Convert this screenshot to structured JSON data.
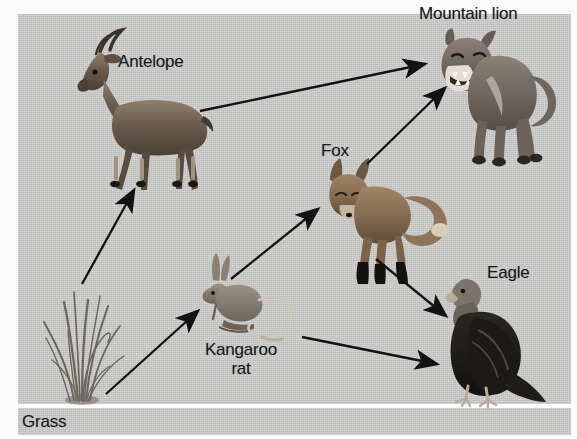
{
  "diagram": {
    "background_color": "#c9c9c7",
    "panel": {
      "x": 18,
      "y": 14,
      "width": 553,
      "height": 390
    },
    "nodes": [
      {
        "id": "grass",
        "label": "Grass",
        "kind": "producer",
        "icon": "grass-icon",
        "label_x": 22,
        "label_y": 412,
        "align": "left"
      },
      {
        "id": "antelope",
        "label": "Antelope",
        "kind": "primary-consumer",
        "icon": "antelope-icon",
        "label_x": 118,
        "label_y": 52,
        "align": "left"
      },
      {
        "id": "kangaroo_rat",
        "label": "Kangaroo\nrat",
        "kind": "primary-consumer",
        "icon": "kangaroo-rat-icon",
        "label_x": 193,
        "label_y": 340,
        "align": "center"
      },
      {
        "id": "fox",
        "label": "Fox",
        "kind": "secondary-consumer",
        "icon": "fox-icon",
        "label_x": 321,
        "label_y": 141,
        "align": "left"
      },
      {
        "id": "eagle",
        "label": "Eagle",
        "kind": "secondary-consumer",
        "icon": "eagle-icon",
        "label_x": 487,
        "label_y": 263,
        "align": "left"
      },
      {
        "id": "mountain_lion",
        "label": "Mountain lion",
        "kind": "tertiary-consumer",
        "icon": "mountain-lion-icon",
        "label_x": 419,
        "label_y": 4,
        "align": "left"
      }
    ],
    "edges": [
      {
        "id": "grass-antelope",
        "from": "grass",
        "to": "antelope",
        "x1": 82,
        "y1": 284,
        "x2": 134,
        "y2": 190
      },
      {
        "id": "grass-kangaroo-rat",
        "from": "grass",
        "to": "kangaroo_rat",
        "x1": 106,
        "y1": 394,
        "x2": 198,
        "y2": 311
      },
      {
        "id": "antelope-lion",
        "from": "antelope",
        "to": "mountain_lion",
        "x1": 200,
        "y1": 111,
        "x2": 425,
        "y2": 64
      },
      {
        "id": "kangaroo-rat-fox",
        "from": "kangaroo_rat",
        "to": "fox",
        "x1": 231,
        "y1": 279,
        "x2": 318,
        "y2": 209
      },
      {
        "id": "kangaroo-rat-eagle",
        "from": "kangaroo_rat",
        "to": "eagle",
        "x1": 302,
        "y1": 337,
        "x2": 437,
        "y2": 364
      },
      {
        "id": "fox-lion",
        "from": "fox",
        "to": "mountain_lion",
        "x1": 367,
        "y1": 164,
        "x2": 445,
        "y2": 88
      },
      {
        "id": "fox-eagle",
        "from": "fox",
        "to": "eagle",
        "x1": 376,
        "y1": 259,
        "x2": 446,
        "y2": 316
      }
    ],
    "arrow_color": "#121212"
  }
}
